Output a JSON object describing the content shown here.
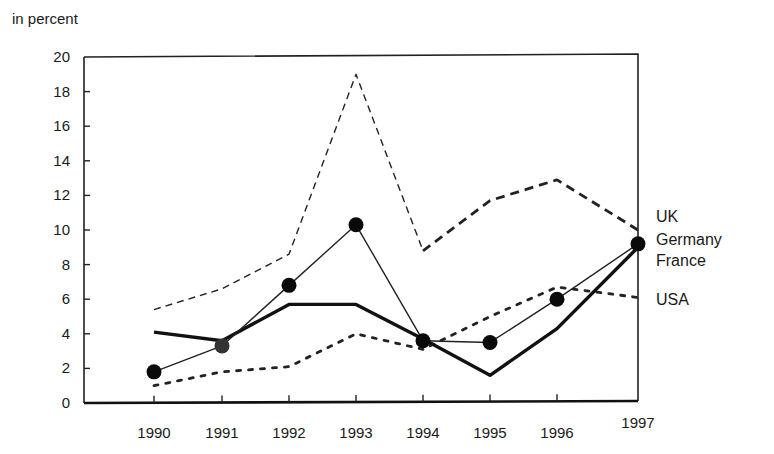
{
  "chart_data": {
    "type": "line",
    "title": "",
    "ylabel": "in percent",
    "xlabel": "",
    "x": [
      "1990",
      "1991",
      "1992",
      "1993",
      "1994",
      "1995",
      "1996",
      "1997"
    ],
    "ylim": [
      0,
      20
    ],
    "yticks": [
      0,
      2,
      4,
      6,
      8,
      10,
      12,
      14,
      16,
      18,
      20
    ],
    "grid": false,
    "legend_position": "right, labels placed at line ends",
    "series": [
      {
        "name": "UK",
        "style": "dashed (thin 1990-1994, thick 1994-1997)",
        "values": [
          5.4,
          6.6,
          8.6,
          19.0,
          8.8,
          11.7,
          12.9,
          10.0
        ]
      },
      {
        "name": "Germany",
        "style": "thin solid with filled circle markers",
        "values": [
          1.8,
          3.3,
          6.8,
          10.3,
          3.6,
          3.5,
          6.0,
          9.2
        ]
      },
      {
        "name": "France",
        "style": "thick solid",
        "values": [
          4.1,
          3.6,
          5.7,
          5.7,
          3.7,
          1.6,
          4.3,
          9.0
        ]
      },
      {
        "name": "USA",
        "style": "dotted",
        "values": [
          1.0,
          1.8,
          2.1,
          4.0,
          3.1,
          5.0,
          6.7,
          6.1
        ]
      }
    ]
  },
  "labels": {
    "ylabel": "in percent",
    "legend": [
      "UK",
      "Germany",
      "France",
      "USA"
    ]
  }
}
